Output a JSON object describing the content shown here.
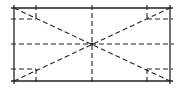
{
  "diagram": {
    "type": "rectangle-layout-with-diagonals",
    "stroke_color": "#222222",
    "background": "#ffffff",
    "outer_rect": {
      "x1": 14,
      "y1": 8,
      "x2": 170,
      "y2": 81
    },
    "center": {
      "x": 92,
      "y": 44
    },
    "inset_verticals_x": [
      36,
      147
    ],
    "inset_horizontals_y": [
      19,
      69
    ],
    "corner_marks": [
      "top-left",
      "top-right",
      "bottom-left",
      "bottom-right"
    ]
  }
}
